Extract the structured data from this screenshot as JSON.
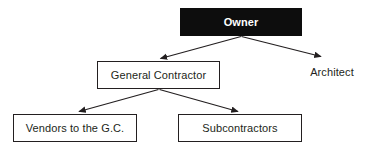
{
  "diagram": {
    "type": "organizational-hierarchy-chart",
    "title": "",
    "background_color": "#ffffff",
    "line_color": "#231f20",
    "nodes": [
      {
        "id": "owner",
        "label": "Owner",
        "style": "filled",
        "fill_color": "#0d0d0d",
        "text_color": "#ffffff",
        "bold": true,
        "level": 1
      },
      {
        "id": "general-contractor",
        "label": "General Contractor",
        "style": "boxed",
        "fill_color": "#ffffff",
        "text_color": "#231f20",
        "bold": false,
        "level": 2
      },
      {
        "id": "architect",
        "label": "Architect",
        "style": "plain-text",
        "fill_color": "transparent",
        "text_color": "#231f20",
        "bold": false,
        "level": 2
      },
      {
        "id": "vendors-to-the-gc",
        "label": "Vendors to the G.C.",
        "style": "boxed",
        "fill_color": "#ffffff",
        "text_color": "#231f20",
        "bold": false,
        "level": 3
      },
      {
        "id": "subcontractors",
        "label": "Subcontractors",
        "style": "boxed",
        "fill_color": "#ffffff",
        "text_color": "#231f20",
        "bold": false,
        "level": 3
      }
    ],
    "edges": [
      {
        "id": "owner-to-general-contractor",
        "from": "owner",
        "to": "general-contractor",
        "arrowhead": "filled-triangle"
      },
      {
        "id": "owner-to-architect",
        "from": "owner",
        "to": "architect",
        "arrowhead": "filled-triangle"
      },
      {
        "id": "gc-to-vendors",
        "from": "general-contractor",
        "to": "vendors-to-the-gc",
        "arrowhead": "filled-triangle"
      },
      {
        "id": "gc-to-subcontractors",
        "from": "general-contractor",
        "to": "subcontractors",
        "arrowhead": "filled-triangle"
      }
    ]
  }
}
